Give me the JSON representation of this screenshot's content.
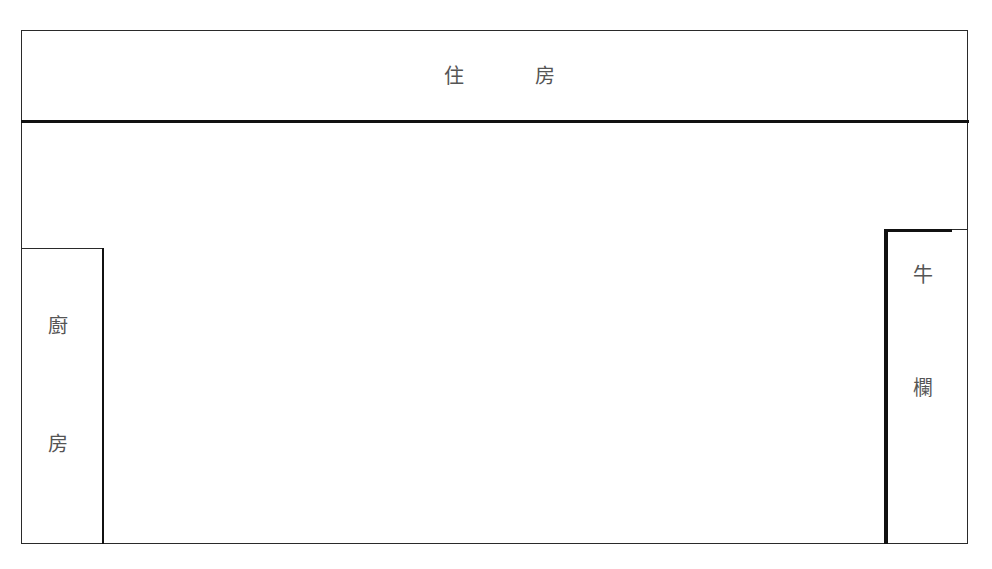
{
  "diagram": {
    "type": "floor-plan",
    "rooms": {
      "house": {
        "chars": [
          "住",
          "房"
        ]
      },
      "kitchen": {
        "chars": [
          "廚",
          "房"
        ]
      },
      "cattle_pen": {
        "chars": [
          "牛",
          "欄"
        ]
      }
    },
    "colors": {
      "line": "#2a2a2a",
      "text": "#555555",
      "background": "#ffffff"
    }
  }
}
